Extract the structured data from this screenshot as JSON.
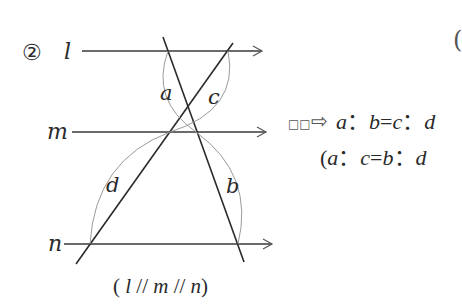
{
  "problem": {
    "number_label": "②",
    "cut_paren_top_right": "("
  },
  "lines": {
    "l": {
      "label": "l",
      "y": 51
    },
    "m": {
      "label": "m",
      "y": 132
    },
    "n": {
      "label": "n",
      "y": 244
    }
  },
  "segments": {
    "a": "a",
    "b": "b",
    "c": "c",
    "d": "d"
  },
  "caption": "（l // m // n）",
  "caption_parts": [
    "(",
    "l",
    " // ",
    "m",
    " // ",
    "n",
    ")"
  ],
  "result": {
    "box_glyphs": "□□",
    "arrow": "⇨",
    "line1": {
      "p1": "a",
      "sep1": "：",
      "p2": "b",
      "eq": "=",
      "p3": "c",
      "sep2": "：",
      "p4": "d"
    },
    "line2": {
      "open": "(",
      "p1": "a",
      "sep1": "：",
      "p2": "c",
      "eq": "=",
      "p3": "b",
      "sep2": "：",
      "p4": "d"
    }
  },
  "colors": {
    "line": "#2a2a2a",
    "arc": "#9a9a9a",
    "arrowhead": "#555555"
  }
}
